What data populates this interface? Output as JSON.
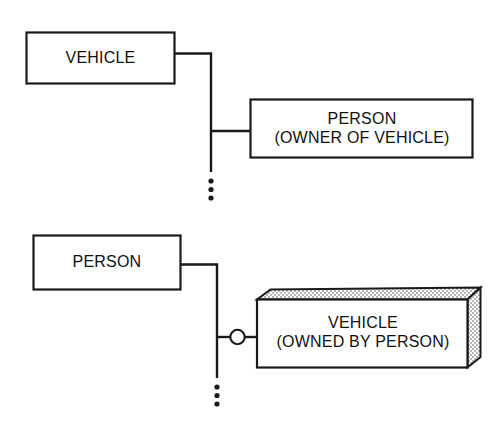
{
  "diagram": {
    "background_color": "#ffffff",
    "stroke_color": "#1a1a1a",
    "stipple_color": "#555555",
    "panels": [
      {
        "id": "panel-vehicle-owner",
        "source_box": {
          "label": "VEHICLE"
        },
        "target_box": {
          "line1": "PERSON",
          "line2": "(OWNER OF VEHICLE)"
        },
        "junction": "none",
        "continuation": "vertical-ellipsis",
        "ellipsis_dots": 3
      },
      {
        "id": "panel-person-owned",
        "source_box": {
          "label": "PERSON"
        },
        "target_box": {
          "line1": "VEHICLE",
          "line2": "(OWNED BY PERSON)",
          "style": "3d-stippled"
        },
        "junction": "circle",
        "continuation": "vertical-ellipsis",
        "ellipsis_dots": 3
      }
    ]
  }
}
